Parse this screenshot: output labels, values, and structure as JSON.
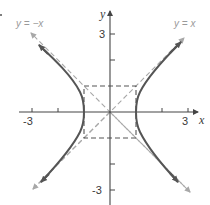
{
  "diagram": {
    "title": "",
    "equation": "x^2 - y^2 = 1",
    "axes": {
      "x_label": "x",
      "y_label": "y",
      "x_tick_labels": [
        "-3",
        "3"
      ],
      "y_tick_labels": [
        "3",
        "-3"
      ],
      "x_ticks": [
        -3,
        -2,
        2,
        3
      ],
      "y_ticks": [
        3,
        2,
        -2,
        -3
      ],
      "range": {
        "x": [
          -3.5,
          3.4
        ],
        "y": [
          -3.6,
          3.9
        ]
      }
    },
    "asymptotes": [
      {
        "label": "y = −x",
        "slope": -1,
        "style": "dashed"
      },
      {
        "label": "y = x",
        "slope": 1,
        "style": "dashed"
      }
    ],
    "fundamental_rectangle": {
      "x": [
        -1,
        1
      ],
      "y": [
        -1,
        1
      ],
      "style": "dashed"
    },
    "vertices": [
      [
        -1,
        0
      ],
      [
        1,
        0
      ]
    ],
    "colors": {
      "curve": "#555555",
      "asymptote": "#a8a8a8",
      "box": "#555555",
      "axis": "#444444"
    }
  }
}
